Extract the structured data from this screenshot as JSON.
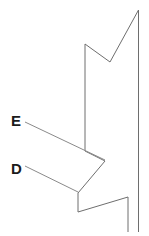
{
  "figure": {
    "background_color": "#ffffff",
    "outline_color": "#6e6e6e",
    "leader_color": "#8a8a8a",
    "label_color": "#1b1b1b",
    "width": 149,
    "height": 236,
    "labels": [
      {
        "id": "E",
        "text": "E",
        "x": 11,
        "y": 113
      },
      {
        "id": "D",
        "text": "D",
        "x": 11,
        "y": 161
      }
    ],
    "leaders": [
      {
        "id": "leader-e",
        "for": "E",
        "points": "25,122 105,160"
      },
      {
        "id": "leader-d",
        "for": "D",
        "points": "25,166 78,192"
      }
    ],
    "outlines": [
      {
        "id": "right-edge",
        "description": "long right vertical edge",
        "points": "138.5,10 138.5,232"
      },
      {
        "id": "upper-notch",
        "description": "V notch at top formed by two diagonals and a left vertical",
        "points": "138.5,10 110,62 85,44 85,151"
      },
      {
        "id": "lower-body",
        "description": "lower profile with step notch and inner vertical",
        "points": "85,151 105,161 78,193 78,212 128,197 128,232"
      }
    ]
  }
}
